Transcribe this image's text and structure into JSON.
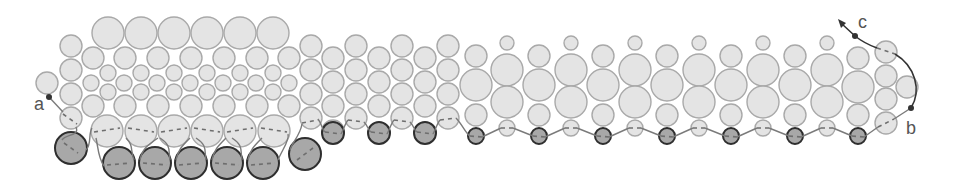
{
  "figure": {
    "width": 954,
    "height": 185
  },
  "colors": {
    "bead_light_fill": "#e4e4e4",
    "bead_light_stroke": "#a9a9a9",
    "bead_dark_fill": "#a8a8a8",
    "bead_dark_stroke": "#2e2e2e",
    "thread": "#7a7a7a",
    "lead_thread": "#333333"
  },
  "labels": [
    {
      "id": "a",
      "text": "a",
      "x": 34,
      "y": 110
    },
    {
      "id": "b",
      "text": "b",
      "x": 906,
      "y": 134
    },
    {
      "id": "c",
      "text": "c",
      "x": 858,
      "y": 28
    }
  ],
  "points": [
    {
      "id": "a",
      "x": 49,
      "y": 97
    },
    {
      "id": "b",
      "x": 911,
      "y": 108
    },
    {
      "id": "c",
      "x": 855,
      "y": 36
    }
  ],
  "beads_light": [
    {
      "x": 108,
      "y": 33,
      "r": 16
    },
    {
      "x": 141,
      "y": 33,
      "r": 16
    },
    {
      "x": 174,
      "y": 33,
      "r": 16
    },
    {
      "x": 207,
      "y": 33,
      "r": 16
    },
    {
      "x": 240,
      "y": 33,
      "r": 16
    },
    {
      "x": 273,
      "y": 33,
      "r": 16
    },
    {
      "x": 71,
      "y": 46,
      "r": 11
    },
    {
      "x": 71,
      "y": 70,
      "r": 11
    },
    {
      "x": 71,
      "y": 94,
      "r": 11
    },
    {
      "x": 71,
      "y": 118,
      "r": 11
    },
    {
      "x": 47,
      "y": 83,
      "r": 11
    },
    {
      "x": 93,
      "y": 58,
      "r": 11
    },
    {
      "x": 125,
      "y": 58,
      "r": 11
    },
    {
      "x": 158,
      "y": 58,
      "r": 11
    },
    {
      "x": 191,
      "y": 58,
      "r": 11
    },
    {
      "x": 224,
      "y": 58,
      "r": 11
    },
    {
      "x": 257,
      "y": 58,
      "r": 11
    },
    {
      "x": 289,
      "y": 58,
      "r": 11
    },
    {
      "x": 108,
      "y": 73,
      "r": 8
    },
    {
      "x": 141,
      "y": 73,
      "r": 8
    },
    {
      "x": 174,
      "y": 73,
      "r": 8
    },
    {
      "x": 207,
      "y": 73,
      "r": 8
    },
    {
      "x": 240,
      "y": 73,
      "r": 8
    },
    {
      "x": 273,
      "y": 73,
      "r": 8
    },
    {
      "x": 91,
      "y": 83,
      "r": 8
    },
    {
      "x": 124,
      "y": 83,
      "r": 8
    },
    {
      "x": 157,
      "y": 83,
      "r": 8
    },
    {
      "x": 190,
      "y": 83,
      "r": 8
    },
    {
      "x": 223,
      "y": 83,
      "r": 8
    },
    {
      "x": 256,
      "y": 83,
      "r": 8
    },
    {
      "x": 289,
      "y": 83,
      "r": 8
    },
    {
      "x": 108,
      "y": 92,
      "r": 8
    },
    {
      "x": 141,
      "y": 92,
      "r": 8
    },
    {
      "x": 174,
      "y": 92,
      "r": 8
    },
    {
      "x": 207,
      "y": 92,
      "r": 8
    },
    {
      "x": 240,
      "y": 92,
      "r": 8
    },
    {
      "x": 273,
      "y": 92,
      "r": 8
    },
    {
      "x": 93,
      "y": 106,
      "r": 11
    },
    {
      "x": 125,
      "y": 106,
      "r": 11
    },
    {
      "x": 158,
      "y": 106,
      "r": 11
    },
    {
      "x": 191,
      "y": 106,
      "r": 11
    },
    {
      "x": 224,
      "y": 106,
      "r": 11
    },
    {
      "x": 257,
      "y": 106,
      "r": 11
    },
    {
      "x": 289,
      "y": 106,
      "r": 11
    },
    {
      "x": 107,
      "y": 131,
      "r": 16
    },
    {
      "x": 141,
      "y": 131,
      "r": 16
    },
    {
      "x": 174,
      "y": 131,
      "r": 16
    },
    {
      "x": 207,
      "y": 131,
      "r": 16
    },
    {
      "x": 240,
      "y": 131,
      "r": 16
    },
    {
      "x": 274,
      "y": 131,
      "r": 16
    },
    {
      "x": 311,
      "y": 46,
      "r": 11
    },
    {
      "x": 311,
      "y": 70,
      "r": 11
    },
    {
      "x": 311,
      "y": 94,
      "r": 11
    },
    {
      "x": 311,
      "y": 118,
      "r": 11
    },
    {
      "x": 333,
      "y": 58,
      "r": 11
    },
    {
      "x": 333,
      "y": 82,
      "r": 11
    },
    {
      "x": 333,
      "y": 106,
      "r": 11
    },
    {
      "x": 333,
      "y": 131,
      "r": 11
    },
    {
      "x": 356,
      "y": 46,
      "r": 11
    },
    {
      "x": 356,
      "y": 70,
      "r": 11
    },
    {
      "x": 356,
      "y": 94,
      "r": 11
    },
    {
      "x": 356,
      "y": 118,
      "r": 11
    },
    {
      "x": 379,
      "y": 58,
      "r": 11
    },
    {
      "x": 379,
      "y": 82,
      "r": 11
    },
    {
      "x": 379,
      "y": 106,
      "r": 11
    },
    {
      "x": 402,
      "y": 46,
      "r": 11
    },
    {
      "x": 402,
      "y": 70,
      "r": 11
    },
    {
      "x": 402,
      "y": 94,
      "r": 11
    },
    {
      "x": 402,
      "y": 118,
      "r": 11
    },
    {
      "x": 425,
      "y": 58,
      "r": 11
    },
    {
      "x": 425,
      "y": 82,
      "r": 11
    },
    {
      "x": 425,
      "y": 106,
      "r": 11
    },
    {
      "x": 448,
      "y": 46,
      "r": 11
    },
    {
      "x": 448,
      "y": 70,
      "r": 11
    },
    {
      "x": 448,
      "y": 94,
      "r": 11
    },
    {
      "x": 448,
      "y": 118,
      "r": 11
    },
    {
      "x": 476,
      "y": 56,
      "r": 11
    },
    {
      "x": 476,
      "y": 85,
      "r": 16
    },
    {
      "x": 476,
      "y": 115,
      "r": 11
    },
    {
      "x": 507,
      "y": 43,
      "r": 7
    },
    {
      "x": 507,
      "y": 70,
      "r": 16
    },
    {
      "x": 507,
      "y": 102,
      "r": 16
    },
    {
      "x": 507,
      "y": 128,
      "r": 8
    },
    {
      "x": 539,
      "y": 56,
      "r": 11
    },
    {
      "x": 539,
      "y": 85,
      "r": 16
    },
    {
      "x": 539,
      "y": 115,
      "r": 11
    },
    {
      "x": 571,
      "y": 43,
      "r": 7
    },
    {
      "x": 571,
      "y": 70,
      "r": 16
    },
    {
      "x": 571,
      "y": 102,
      "r": 16
    },
    {
      "x": 571,
      "y": 128,
      "r": 8
    },
    {
      "x": 603,
      "y": 56,
      "r": 11
    },
    {
      "x": 603,
      "y": 85,
      "r": 16
    },
    {
      "x": 603,
      "y": 115,
      "r": 11
    },
    {
      "x": 635,
      "y": 43,
      "r": 7
    },
    {
      "x": 635,
      "y": 70,
      "r": 16
    },
    {
      "x": 635,
      "y": 102,
      "r": 16
    },
    {
      "x": 635,
      "y": 128,
      "r": 8
    },
    {
      "x": 667,
      "y": 56,
      "r": 11
    },
    {
      "x": 667,
      "y": 85,
      "r": 16
    },
    {
      "x": 667,
      "y": 115,
      "r": 11
    },
    {
      "x": 699,
      "y": 43,
      "r": 7
    },
    {
      "x": 699,
      "y": 70,
      "r": 16
    },
    {
      "x": 699,
      "y": 102,
      "r": 16
    },
    {
      "x": 699,
      "y": 128,
      "r": 8
    },
    {
      "x": 731,
      "y": 56,
      "r": 11
    },
    {
      "x": 731,
      "y": 85,
      "r": 16
    },
    {
      "x": 731,
      "y": 115,
      "r": 11
    },
    {
      "x": 763,
      "y": 43,
      "r": 7
    },
    {
      "x": 763,
      "y": 70,
      "r": 16
    },
    {
      "x": 763,
      "y": 102,
      "r": 16
    },
    {
      "x": 763,
      "y": 128,
      "r": 8
    },
    {
      "x": 795,
      "y": 56,
      "r": 11
    },
    {
      "x": 795,
      "y": 85,
      "r": 16
    },
    {
      "x": 795,
      "y": 115,
      "r": 11
    },
    {
      "x": 827,
      "y": 43,
      "r": 7
    },
    {
      "x": 827,
      "y": 70,
      "r": 16
    },
    {
      "x": 827,
      "y": 102,
      "r": 16
    },
    {
      "x": 827,
      "y": 128,
      "r": 8
    },
    {
      "x": 858,
      "y": 58,
      "r": 11
    },
    {
      "x": 858,
      "y": 87,
      "r": 16
    },
    {
      "x": 858,
      "y": 115,
      "r": 11
    },
    {
      "x": 886,
      "y": 52,
      "r": 11
    },
    {
      "x": 886,
      "y": 76,
      "r": 11
    },
    {
      "x": 886,
      "y": 99,
      "r": 11
    },
    {
      "x": 886,
      "y": 123,
      "r": 11
    },
    {
      "x": 907,
      "y": 87,
      "r": 11
    }
  ],
  "beads_dark": [
    {
      "x": 71,
      "y": 148,
      "r": 16
    },
    {
      "x": 119,
      "y": 163,
      "r": 16
    },
    {
      "x": 155,
      "y": 163,
      "r": 16
    },
    {
      "x": 191,
      "y": 163,
      "r": 16
    },
    {
      "x": 227,
      "y": 163,
      "r": 16
    },
    {
      "x": 263,
      "y": 163,
      "r": 16
    },
    {
      "x": 305,
      "y": 154,
      "r": 16
    },
    {
      "x": 333,
      "y": 133,
      "r": 11
    },
    {
      "x": 379,
      "y": 133,
      "r": 11
    },
    {
      "x": 425,
      "y": 133,
      "r": 11
    },
    {
      "x": 476,
      "y": 136,
      "r": 8
    },
    {
      "x": 539,
      "y": 136,
      "r": 8
    },
    {
      "x": 603,
      "y": 136,
      "r": 8
    },
    {
      "x": 667,
      "y": 136,
      "r": 8
    },
    {
      "x": 731,
      "y": 136,
      "r": 8
    },
    {
      "x": 795,
      "y": 136,
      "r": 8
    },
    {
      "x": 858,
      "y": 136,
      "r": 8
    }
  ],
  "dashes": [
    {
      "d": "M63 114 L77 124"
    },
    {
      "d": "M64 143 L78 153"
    },
    {
      "d": "M94 132 L120 128"
    },
    {
      "d": "M128 128 L154 132"
    },
    {
      "d": "M161 132 L187 128"
    },
    {
      "d": "M194 128 L220 132"
    },
    {
      "d": "M227 132 L253 128"
    },
    {
      "d": "M261 128 L287 132"
    },
    {
      "d": "M107 165 L131 163"
    },
    {
      "d": "M143 163 L167 165"
    },
    {
      "d": "M179 165 L203 163"
    },
    {
      "d": "M215 163 L239 165"
    },
    {
      "d": "M251 165 L275 163"
    },
    {
      "d": "M297 160 L313 148"
    },
    {
      "d": "M302 123 L318 120"
    },
    {
      "d": "M325 132 L341 134"
    },
    {
      "d": "M348 120 L364 122"
    },
    {
      "d": "M371 132 L387 134"
    },
    {
      "d": "M394 120 L410 122"
    },
    {
      "d": "M417 132 L433 134"
    },
    {
      "d": "M440 120 L456 118"
    },
    {
      "d": "M470 136 L482 137"
    },
    {
      "d": "M501 128 L513 128"
    },
    {
      "d": "M533 136 L545 137"
    },
    {
      "d": "M565 128 L577 128"
    },
    {
      "d": "M597 136 L609 137"
    },
    {
      "d": "M629 128 L641 128"
    },
    {
      "d": "M661 136 L673 137"
    },
    {
      "d": "M693 128 L705 128"
    },
    {
      "d": "M725 136 L737 137"
    },
    {
      "d": "M757 128 L769 128"
    },
    {
      "d": "M789 136 L801 137"
    },
    {
      "d": "M821 128 L833 128"
    },
    {
      "d": "M852 136 L864 137"
    },
    {
      "d": "M878 127 L894 119"
    },
    {
      "d": "M877 48 L895 54"
    }
  ],
  "thread_paths": [
    {
      "d": "M49 97 L63 112"
    },
    {
      "d": "M76 127 C 80 136, 66 134, 62 140"
    },
    {
      "d": "M86 150 C 92 144, 88 134, 92 128"
    },
    {
      "d": "M104 166 C 98 158, 98 146, 96 138"
    },
    {
      "d": "M134 160 C 130 150, 134 146, 126 138"
    },
    {
      "d": "M140 160 C 142 150, 146 146, 158 138"
    },
    {
      "d": "M170 160 C 168 150, 172 146, 160 138"
    },
    {
      "d": "M176 160 C 178 150, 182 146, 190 138"
    },
    {
      "d": "M206 160 C 204 150, 208 146, 196 138"
    },
    {
      "d": "M212 160 C 214 150, 218 146, 226 138"
    },
    {
      "d": "M242 160 C 240 150, 244 146, 232 138"
    },
    {
      "d": "M248 160 C 250 150, 254 146, 262 138"
    },
    {
      "d": "M278 160 C 282 150, 290 140, 288 134"
    },
    {
      "d": "M290 150 C 292 142, 300 136, 302 124"
    },
    {
      "d": "M318 119 C 322 124, 322 130, 325 132"
    },
    {
      "d": "M341 134 C 344 128, 346 122, 348 120"
    },
    {
      "d": "M364 122 C 368 126, 368 130, 371 132"
    },
    {
      "d": "M387 134 C 390 128, 392 122, 394 120"
    },
    {
      "d": "M410 122 C 414 126, 414 130, 417 132"
    },
    {
      "d": "M433 134 C 436 128, 438 122, 440 120"
    },
    {
      "d": "M456 118 C 462 124, 466 134, 470 136"
    },
    {
      "d": "M482 137 L501 128"
    },
    {
      "d": "M513 128 L533 136"
    },
    {
      "d": "M545 137 L565 128"
    },
    {
      "d": "M577 128 L597 136"
    },
    {
      "d": "M609 137 L629 128"
    },
    {
      "d": "M641 128 L661 136"
    },
    {
      "d": "M673 137 L693 128"
    },
    {
      "d": "M705 128 L725 136"
    },
    {
      "d": "M737 137 L757 128"
    },
    {
      "d": "M769 128 L789 136"
    },
    {
      "d": "M801 137 L821 128"
    },
    {
      "d": "M833 128 L852 136"
    },
    {
      "d": "M864 137 L878 127"
    },
    {
      "d": "M894 119 L911 108"
    }
  ],
  "lead_paths": [
    {
      "d": "M911 108 C 922 90, 915 66, 895 54"
    },
    {
      "d": "M877 48 C 866 44, 860 40, 855 36 L 842 24"
    }
  ],
  "arrowhead": {
    "points": "838,19 846,23 841,28"
  }
}
